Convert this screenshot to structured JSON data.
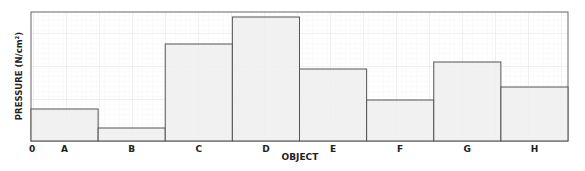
{
  "chart_data": {
    "type": "bar",
    "title": "",
    "xlabel": "OBJECT",
    "ylabel": "PRESSURE (N/cm²)",
    "origin_label": "0",
    "categories": [
      "A",
      "B",
      "C",
      "D",
      "E",
      "F",
      "G",
      "H"
    ],
    "values": [
      32,
      13,
      97,
      124,
      72,
      41,
      79,
      54
    ],
    "ylim": [
      0,
      129
    ],
    "y_tick_labels": [],
    "grid": true,
    "legend": null,
    "bar_fill": "#efefef",
    "bar_edge": "#555555",
    "note": "Values are relative heights (px above baseline); y-axis has no numeric ticks."
  }
}
